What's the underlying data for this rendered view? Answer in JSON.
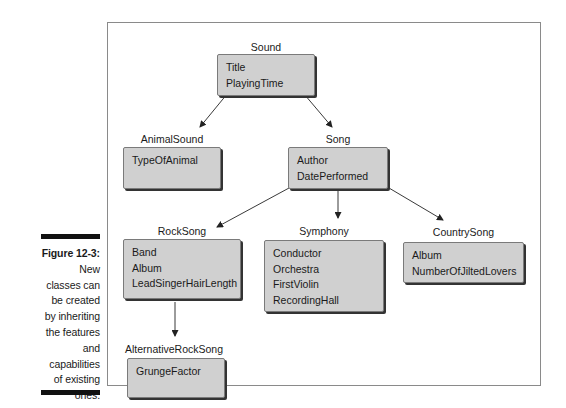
{
  "caption": {
    "figure_label": "Figure 12-3:",
    "lines": [
      "New",
      "classes can",
      "be created",
      "by inheriting",
      "the features",
      "and",
      "capabilities",
      "of existing",
      "ones."
    ]
  },
  "classes": {
    "sound": {
      "name": "Sound",
      "fields": [
        "Title",
        "PlayingTime"
      ]
    },
    "animal_sound": {
      "name": "AnimalSound",
      "fields": [
        "TypeOfAnimal"
      ]
    },
    "song": {
      "name": "Song",
      "fields": [
        "Author",
        "DatePerformed"
      ]
    },
    "rock_song": {
      "name": "RockSong",
      "fields": [
        "Band",
        "Album",
        "LeadSingerHairLength"
      ]
    },
    "symphony": {
      "name": "Symphony",
      "fields": [
        "Conductor",
        "Orchestra",
        "FirstViolin",
        "RecordingHall"
      ]
    },
    "country_song": {
      "name": "CountrySong",
      "fields": [
        "Album",
        "NumberOfJiltedLovers"
      ]
    },
    "alternative_rock_song": {
      "name": "AlternativeRockSong",
      "fields": [
        "GrungeFactor"
      ]
    }
  },
  "edges": [
    {
      "from": "Sound",
      "to": "AnimalSound"
    },
    {
      "from": "Sound",
      "to": "Song"
    },
    {
      "from": "Song",
      "to": "RockSong"
    },
    {
      "from": "Song",
      "to": "Symphony"
    },
    {
      "from": "Song",
      "to": "CountrySong"
    },
    {
      "from": "RockSong",
      "to": "AlternativeRockSong"
    }
  ]
}
